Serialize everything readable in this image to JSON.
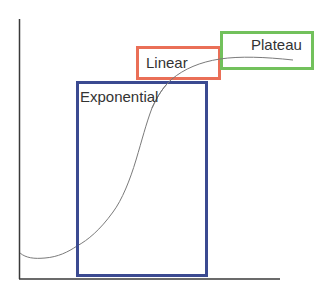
{
  "diagram": {
    "type": "growth-curve-phases",
    "phases": [
      {
        "label": "Exponential",
        "color": "#3b4a91"
      },
      {
        "label": "Linear",
        "color": "#ea6f57"
      },
      {
        "label": "Plateau",
        "color": "#72c15c"
      }
    ],
    "axes": {
      "x_label": "",
      "y_label": "",
      "color": "#333333"
    },
    "curve": {
      "shape": "sigmoid",
      "color": "#7a7a7a"
    }
  }
}
